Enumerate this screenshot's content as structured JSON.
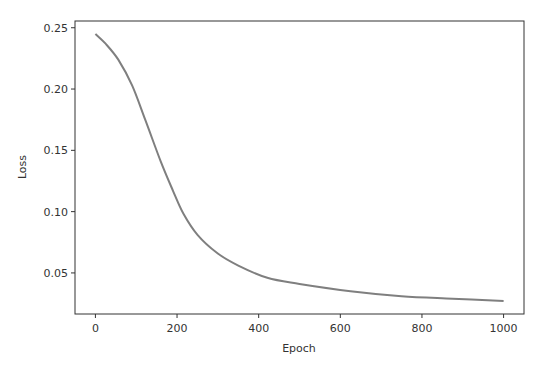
{
  "chart_data": {
    "type": "line",
    "title": "",
    "xlabel": "Epoch",
    "ylabel": "Loss",
    "xlim": [
      -50,
      1050
    ],
    "ylim": [
      0.0165,
      0.2555
    ],
    "x_ticks": [
      0,
      200,
      400,
      600,
      800,
      1000
    ],
    "x_tick_labels": [
      "0",
      "200",
      "400",
      "600",
      "800",
      "1000"
    ],
    "y_ticks": [
      0.05,
      0.1,
      0.15,
      0.2,
      0.25
    ],
    "y_tick_labels": [
      "0.05",
      "0.10",
      "0.15",
      "0.20",
      "0.25"
    ],
    "grid": false,
    "legend": null,
    "line_color": "#7f7f7f",
    "series": [
      {
        "name": "Loss",
        "x": [
          0,
          25,
          56,
          90,
          122,
          160,
          190,
          216,
          250,
          299,
          350,
          421,
          500,
          625,
          750,
          875,
          1000
        ],
        "values": [
          0.245,
          0.237,
          0.224,
          0.203,
          0.175,
          0.141,
          0.117,
          0.098,
          0.081,
          0.066,
          0.056,
          0.046,
          0.041,
          0.035,
          0.031,
          0.029,
          0.027
        ]
      }
    ]
  }
}
